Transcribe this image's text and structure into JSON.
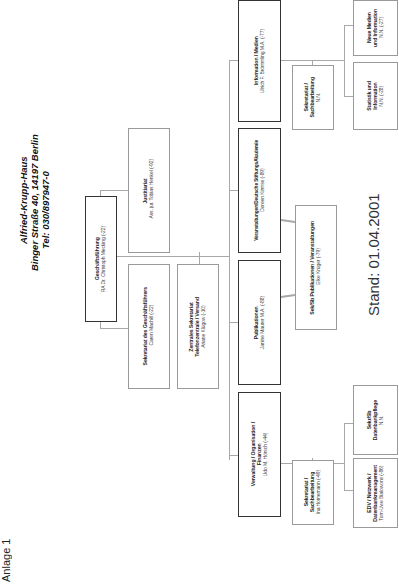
{
  "page": {
    "annex_label": "Anlage 1",
    "header": {
      "name": "Alfried-Krupp-Haus",
      "address": "Binger Straße 40, 14197 Berlin",
      "phone": "Tel: 030/897947-0"
    },
    "status_date": "Stand: 01.04.2001"
  },
  "org": {
    "management": {
      "title": "Geschäftsführung",
      "person": "RA Dr. Christoph Mecking (-22)"
    },
    "legal": {
      "title": "Justitiariat",
      "person": "Ass. jur. Tobias Henkel (-92)"
    },
    "secretary_gf": {
      "title": "Sekretariat des Geschäftsführers",
      "person": "Caren Machill (-22)"
    },
    "central_secretary": {
      "title_1": "Zentrales Sekretariat",
      "title_2": "Telefonzentrale / Versand",
      "person": "Ariane Klügow (-10)"
    },
    "departments": [
      {
        "title": "Information / Medien",
        "person": "Ulrich F. Brömmling M.A. (-77)"
      },
      {
        "title": "Veranstaltungen/Deutsche StiftungsAkademie",
        "person": "Doreen Kirmse (-89)"
      },
      {
        "title": "Publikationen",
        "person": "Janine Maurer M.A. (-88)"
      },
      {
        "title_1": "Verwaltung / Organisation /",
        "title_2": "Finanzen",
        "person": "Udo M. Hörsch (-44)"
      }
    ],
    "info_secretariat": {
      "title_1": "Sekretariat /",
      "title_2": "Sachbearbeitung",
      "person": "N.N."
    },
    "statistics": {
      "title_1": "Statistik  und",
      "title_2": "Information",
      "person": "N.N. (-28)"
    },
    "new_media": {
      "title_1": "Neue Medien",
      "title_2": "und Information",
      "person": "N.N. (-27)"
    },
    "pub_events_secretary": {
      "title": "Sek/Sb Publikationen / Veranstaltungen",
      "person": "Elke Krüger (-79)"
    },
    "admin_secretariat": {
      "title_1": "Sekretariat /",
      "title_2": "Sachbearbeitung",
      "person": "Ina Homemann (-49)"
    },
    "database_care": {
      "title_1": "Sekr/Sb",
      "title_2": "Datenbankpflege",
      "person": "N.N."
    },
    "it": {
      "title_1": "EDV / Netzwerk /",
      "title_2": "Datenbankmanagement",
      "person": "Tom-Uwe Bialowons (-86)"
    }
  }
}
